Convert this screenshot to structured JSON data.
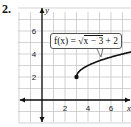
{
  "problem_number": "2.",
  "chart_data": {
    "type": "line",
    "title": "",
    "function_label": "f(x) = √(x − 3) + 2",
    "function_label_parts": {
      "lhs": "f(x) = ",
      "radical": "x − 3",
      "rest": " + 2"
    },
    "xlabel": "x",
    "ylabel": "y",
    "x_ticks": [
      2,
      4,
      6
    ],
    "y_ticks": [
      2,
      4,
      6
    ],
    "xlim": [
      -2,
      8
    ],
    "ylim": [
      -2,
      8
    ],
    "grid": true,
    "start_point": {
      "x": 3,
      "y": 2,
      "filled": true
    },
    "series": [
      {
        "name": "f(x) = sqrt(x - 3) + 2",
        "x": [
          3,
          3.25,
          3.5,
          4,
          5,
          6,
          7,
          7.7
        ],
        "y": [
          2,
          2.5,
          2.71,
          3,
          3.41,
          3.73,
          4,
          4.17
        ]
      }
    ],
    "colors": {
      "curve": "#111111",
      "grid": "#c8c8c8",
      "axes": "#111111"
    }
  }
}
